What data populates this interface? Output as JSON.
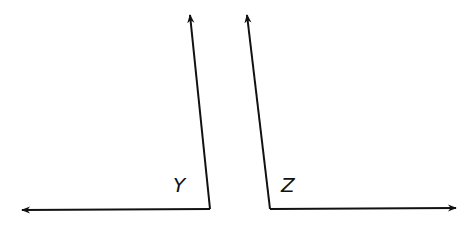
{
  "diagram": {
    "angles": [
      {
        "label": "Y",
        "vertex": [
          210,
          209
        ],
        "rays": [
          [
            20,
            210
          ],
          [
            190,
            14
          ]
        ]
      },
      {
        "label": "Z",
        "vertex": [
          270,
          209
        ],
        "rays": [
          [
            458,
            208
          ],
          [
            247,
            14
          ]
        ]
      }
    ],
    "stroke_color": "#111111"
  }
}
